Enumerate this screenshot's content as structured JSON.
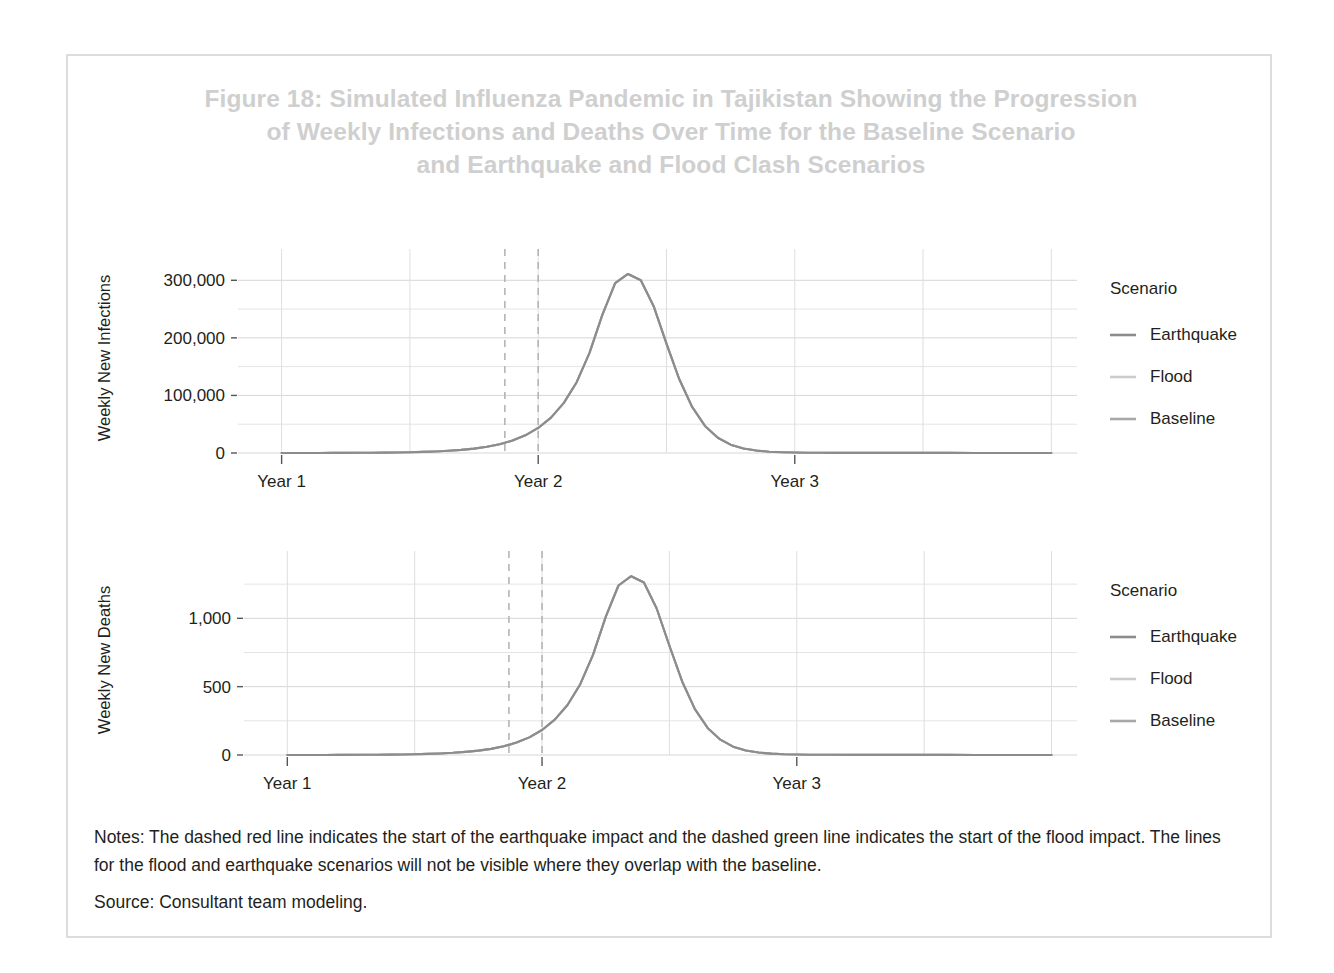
{
  "figure": {
    "title": "Figure 18: Simulated Influenza Pandemic in Tajikistan Showing the Progression\nof Weekly Infections and Deaths Over Time for the Baseline Scenario\nand Earthquake and Flood Clash Scenarios",
    "title_color": "#cfcfcf",
    "border_color": "#dcdcdc",
    "background_color": "#ffffff"
  },
  "notes": {
    "notes_label": "Notes:",
    "notes_text": "Notes: The dashed red line indicates the start of the earthquake impact and the dashed green line indicates the start of the flood impact. The lines for the flood and earthquake scenarios will not be visible where they overlap with the baseline.",
    "source_text": "Source: Consultant team modeling."
  },
  "legend": {
    "title": "Scenario",
    "entries": [
      {
        "label": "Earthquake",
        "color": "#8c8c8c"
      },
      {
        "label": "Flood",
        "color": "#cccccc"
      },
      {
        "label": "Baseline",
        "color": "#a8a8a8"
      }
    ]
  },
  "chart_data": [
    {
      "id": "weekly-new-infections",
      "type": "line",
      "title": "",
      "xlabel": "",
      "ylabel": "Weekly New Infections",
      "x": [
        0,
        0.05,
        0.1,
        0.15,
        0.2,
        0.25,
        0.3,
        0.35,
        0.4,
        0.45,
        0.5,
        0.55,
        0.6,
        0.65,
        0.7,
        0.75,
        0.8,
        0.85,
        0.9,
        0.95,
        1.0,
        1.05,
        1.1,
        1.15,
        1.2,
        1.25,
        1.3,
        1.35,
        1.4,
        1.45,
        1.5,
        1.55,
        1.6,
        1.65,
        1.7,
        1.75,
        1.8,
        1.85,
        1.9,
        1.95,
        2.0,
        2.05,
        2.1,
        2.15,
        2.2,
        2.3,
        2.4,
        2.5,
        2.6,
        2.7,
        2.8,
        2.9,
        3.0
      ],
      "xtick_values": [
        0,
        1,
        2
      ],
      "xtick_labels": [
        "Year 1",
        "Year 2",
        "Year 3"
      ],
      "ytick_values": [
        0,
        100000,
        200000,
        300000
      ],
      "ytick_labels": [
        "0",
        "100,000",
        "200,000",
        "300,000"
      ],
      "yminor_values": [
        50000,
        150000,
        250000
      ],
      "ylim": [
        0,
        330000
      ],
      "xlim": [
        -0.17,
        3.1
      ],
      "grid": true,
      "legend_position": "right",
      "series": [
        {
          "name": "Baseline",
          "color": "#a8a8a8",
          "values": [
            0,
            40,
            70,
            110,
            160,
            230,
            330,
            470,
            670,
            950,
            1350,
            1900,
            2700,
            3800,
            5400,
            7600,
            10800,
            15300,
            21700,
            30700,
            43500,
            61500,
            87000,
            123000,
            174000,
            240000,
            295000,
            311000,
            300000,
            255000,
            190000,
            128000,
            80000,
            47000,
            26500,
            14500,
            7800,
            4200,
            2300,
            1300,
            800,
            520,
            380,
            300,
            250,
            200,
            170,
            150,
            140,
            130,
            125,
            120,
            118
          ]
        },
        {
          "name": "Earthquake",
          "color": "#8c8c8c",
          "values": [
            0,
            40,
            70,
            110,
            160,
            230,
            330,
            470,
            670,
            950,
            1350,
            1900,
            2700,
            3800,
            5400,
            7600,
            10800,
            15300,
            21700,
            30700,
            43500,
            61500,
            87000,
            123000,
            174000,
            240000,
            295000,
            311000,
            300000,
            255000,
            190000,
            128000,
            80000,
            47000,
            26500,
            14500,
            7800,
            4200,
            2300,
            1300,
            800,
            520,
            380,
            300,
            250,
            200,
            170,
            150,
            140,
            130,
            125,
            120,
            118
          ]
        },
        {
          "name": "Flood",
          "color": "#cccccc",
          "values": [
            0,
            40,
            70,
            110,
            160,
            230,
            330,
            470,
            670,
            950,
            1350,
            1900,
            2700,
            3800,
            5400,
            7600,
            10800,
            15300,
            21700,
            30700,
            43500,
            61500,
            87000,
            123000,
            174000,
            240000,
            295000,
            311000,
            300000,
            255000,
            190000,
            128000,
            80000,
            47000,
            26500,
            14500,
            7800,
            4200,
            2300,
            1300,
            800,
            520,
            380,
            300,
            250,
            200,
            170,
            150,
            140,
            130,
            125,
            120,
            118
          ]
        }
      ],
      "vlines": [
        {
          "name": "earthquake-start",
          "x": 0.87,
          "style": "dashed",
          "described_color": "red"
        },
        {
          "name": "flood-start",
          "x": 1.0,
          "style": "dashed",
          "described_color": "green"
        }
      ]
    },
    {
      "id": "weekly-new-deaths",
      "type": "line",
      "title": "",
      "xlabel": "",
      "ylabel": "Weekly New Deaths",
      "x": [
        0,
        0.05,
        0.1,
        0.15,
        0.2,
        0.25,
        0.3,
        0.35,
        0.4,
        0.45,
        0.5,
        0.55,
        0.6,
        0.65,
        0.7,
        0.75,
        0.8,
        0.85,
        0.9,
        0.95,
        1.0,
        1.05,
        1.1,
        1.15,
        1.2,
        1.25,
        1.3,
        1.35,
        1.4,
        1.45,
        1.5,
        1.55,
        1.6,
        1.65,
        1.7,
        1.75,
        1.8,
        1.85,
        1.9,
        1.95,
        2.0,
        2.05,
        2.1,
        2.15,
        2.2,
        2.3,
        2.4,
        2.5,
        2.6,
        2.7,
        2.8,
        2.9,
        3.0
      ],
      "xtick_values": [
        0,
        1,
        2
      ],
      "xtick_labels": [
        "Year 1",
        "Year 2",
        "Year 3"
      ],
      "ytick_values": [
        0,
        500,
        1000
      ],
      "ytick_labels": [
        "0",
        "500",
        "1,000"
      ],
      "yminor_values": [
        250,
        750,
        1250
      ],
      "ylim": [
        0,
        1390
      ],
      "xlim": [
        -0.17,
        3.1
      ],
      "grid": true,
      "legend_position": "right",
      "series": [
        {
          "name": "Baseline",
          "color": "#a8a8a8",
          "values": [
            0,
            0.2,
            0.3,
            0.5,
            0.7,
            1,
            1.4,
            2,
            2.9,
            4,
            5.7,
            8,
            11.4,
            16,
            23,
            32,
            45,
            64,
            91,
            129,
            183,
            259,
            366,
            518,
            733,
            1010,
            1240,
            1308,
            1262,
            1072,
            799,
            538,
            336,
            198,
            112,
            61,
            33,
            18,
            10,
            5.5,
            3.4,
            2.2,
            1.6,
            1.3,
            1.1,
            0.9,
            0.7,
            0.6,
            0.6,
            0.5,
            0.5,
            0.5,
            0.5
          ]
        },
        {
          "name": "Earthquake",
          "color": "#8c8c8c",
          "values": [
            0,
            0.2,
            0.3,
            0.5,
            0.7,
            1,
            1.4,
            2,
            2.9,
            4,
            5.7,
            8,
            11.4,
            16,
            23,
            32,
            45,
            64,
            91,
            129,
            183,
            259,
            366,
            518,
            733,
            1010,
            1240,
            1308,
            1262,
            1072,
            799,
            538,
            336,
            198,
            112,
            61,
            33,
            18,
            10,
            5.5,
            3.4,
            2.2,
            1.6,
            1.3,
            1.1,
            0.9,
            0.7,
            0.6,
            0.6,
            0.5,
            0.5,
            0.5,
            0.5
          ]
        },
        {
          "name": "Flood",
          "color": "#cccccc",
          "values": [
            0,
            0.2,
            0.3,
            0.5,
            0.7,
            1,
            1.4,
            2,
            2.9,
            4,
            5.7,
            8,
            11.4,
            16,
            23,
            32,
            45,
            64,
            91,
            129,
            183,
            259,
            366,
            518,
            733,
            1010,
            1240,
            1308,
            1262,
            1072,
            799,
            538,
            336,
            198,
            112,
            61,
            33,
            18,
            10,
            5.5,
            3.4,
            2.2,
            1.6,
            1.3,
            1.1,
            0.9,
            0.7,
            0.6,
            0.6,
            0.5,
            0.5,
            0.5,
            0.5
          ]
        }
      ],
      "vlines": [
        {
          "name": "earthquake-start",
          "x": 0.87,
          "style": "dashed",
          "described_color": "red"
        },
        {
          "name": "flood-start",
          "x": 1.0,
          "style": "dashed",
          "described_color": "green"
        }
      ]
    }
  ]
}
